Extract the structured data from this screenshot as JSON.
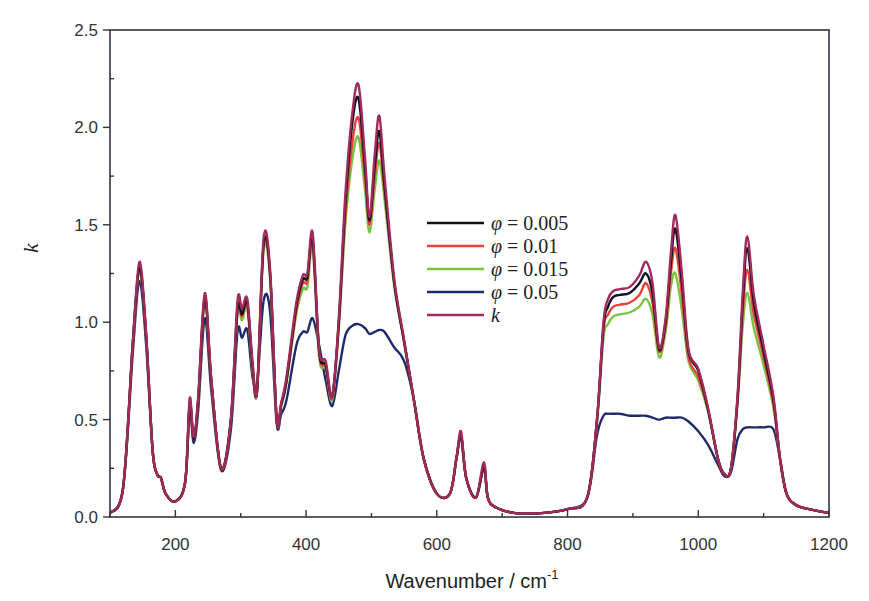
{
  "chart_data": {
    "type": "line",
    "title": "",
    "xlabel": "Wavenumber / cm-1",
    "xlabel_main": "Wavenumber / cm",
    "xlabel_sup": "-1",
    "ylabel": "k",
    "xlim": [
      100,
      1200
    ],
    "ylim": [
      0.0,
      2.5
    ],
    "xticks": [
      200,
      400,
      600,
      800,
      1000,
      1200
    ],
    "xtick_labels": [
      "200",
      "400",
      "600",
      "800",
      "1000",
      "1200"
    ],
    "yticks": [
      0.0,
      0.5,
      1.0,
      1.5,
      2.0,
      2.5
    ],
    "ytick_labels": [
      "0.0",
      "0.5",
      "1.0",
      "1.5",
      "2.0",
      "2.5"
    ],
    "grid": false,
    "legend_position": "center-right",
    "legend": [
      {
        "symbol": "φ",
        "eq": " = ",
        "value": "0.005",
        "color": "#111122"
      },
      {
        "symbol": "φ",
        "eq": " = ",
        "value": "0.01",
        "color": "#e8413a"
      },
      {
        "symbol": "φ",
        "eq": " = ",
        "value": "0.015",
        "color": "#7cc242"
      },
      {
        "symbol": "φ",
        "eq": " = ",
        "value": "0.05",
        "color": "#1f2a6b"
      },
      {
        "symbol": "k",
        "eq": "",
        "value": "",
        "color": "#a02a5a"
      }
    ],
    "x": [
      100,
      120,
      135,
      145,
      155,
      165,
      172,
      178,
      185,
      200,
      215,
      222,
      228,
      235,
      245,
      255,
      270,
      285,
      295,
      302,
      310,
      318,
      325,
      335,
      345,
      355,
      362,
      370,
      385,
      395,
      402,
      410,
      420,
      430,
      440,
      450,
      460,
      470,
      480,
      490,
      497,
      505,
      512,
      520,
      535,
      550,
      565,
      580,
      600,
      620,
      630,
      637,
      645,
      660,
      672,
      678,
      690,
      720,
      760,
      800,
      830,
      845,
      855,
      862,
      870,
      880,
      895,
      910,
      920,
      930,
      940,
      950,
      958,
      965,
      975,
      985,
      1000,
      1015,
      1030,
      1040,
      1050,
      1060,
      1068,
      1075,
      1085,
      1100,
      1115,
      1125,
      1135,
      1150,
      1170,
      1200
    ],
    "series": [
      {
        "name": "φ = 0.005",
        "color": "#111122",
        "values": [
          0.02,
          0.15,
          0.9,
          1.28,
          0.95,
          0.35,
          0.22,
          0.2,
          0.12,
          0.08,
          0.18,
          0.58,
          0.4,
          0.6,
          1.13,
          0.7,
          0.25,
          0.5,
          1.07,
          1.04,
          1.1,
          0.78,
          0.65,
          1.4,
          1.25,
          0.5,
          0.58,
          0.7,
          1.08,
          1.22,
          1.23,
          1.43,
          0.85,
          0.78,
          0.62,
          1.0,
          1.6,
          2.0,
          2.15,
          1.8,
          1.52,
          1.8,
          1.98,
          1.7,
          1.2,
          0.9,
          0.6,
          0.3,
          0.12,
          0.12,
          0.3,
          0.42,
          0.2,
          0.1,
          0.26,
          0.1,
          0.05,
          0.02,
          0.02,
          0.04,
          0.1,
          0.5,
          0.98,
          1.08,
          1.13,
          1.14,
          1.15,
          1.2,
          1.25,
          1.15,
          0.86,
          1.0,
          1.3,
          1.48,
          1.2,
          0.85,
          0.75,
          0.55,
          0.3,
          0.22,
          0.25,
          0.6,
          1.1,
          1.38,
          1.1,
          0.85,
          0.6,
          0.3,
          0.12,
          0.06,
          0.04,
          0.02
        ]
      },
      {
        "name": "φ = 0.01",
        "color": "#e8413a",
        "values": [
          0.02,
          0.15,
          0.9,
          1.27,
          0.95,
          0.35,
          0.22,
          0.2,
          0.12,
          0.08,
          0.18,
          0.57,
          0.4,
          0.6,
          1.12,
          0.7,
          0.25,
          0.5,
          1.06,
          1.03,
          1.09,
          0.77,
          0.65,
          1.39,
          1.24,
          0.5,
          0.58,
          0.7,
          1.06,
          1.2,
          1.21,
          1.41,
          0.84,
          0.77,
          0.61,
          0.99,
          1.55,
          1.9,
          2.05,
          1.75,
          1.5,
          1.75,
          1.92,
          1.68,
          1.2,
          0.9,
          0.6,
          0.3,
          0.12,
          0.12,
          0.3,
          0.42,
          0.2,
          0.1,
          0.26,
          0.1,
          0.05,
          0.02,
          0.02,
          0.04,
          0.1,
          0.5,
          0.96,
          1.04,
          1.08,
          1.09,
          1.1,
          1.14,
          1.2,
          1.1,
          0.85,
          0.98,
          1.25,
          1.38,
          1.14,
          0.82,
          0.72,
          0.55,
          0.3,
          0.22,
          0.25,
          0.6,
          1.05,
          1.27,
          1.04,
          0.82,
          0.58,
          0.3,
          0.12,
          0.06,
          0.04,
          0.02
        ]
      },
      {
        "name": "φ = 0.015",
        "color": "#7cc242",
        "values": [
          0.02,
          0.15,
          0.9,
          1.26,
          0.95,
          0.35,
          0.22,
          0.2,
          0.12,
          0.08,
          0.18,
          0.57,
          0.4,
          0.6,
          1.11,
          0.7,
          0.25,
          0.5,
          1.04,
          1.01,
          1.07,
          0.76,
          0.64,
          1.37,
          1.22,
          0.5,
          0.57,
          0.69,
          1.04,
          1.17,
          1.18,
          1.38,
          0.82,
          0.76,
          0.6,
          0.97,
          1.5,
          1.82,
          1.95,
          1.68,
          1.46,
          1.68,
          1.83,
          1.63,
          1.18,
          0.9,
          0.6,
          0.3,
          0.12,
          0.12,
          0.3,
          0.42,
          0.2,
          0.1,
          0.26,
          0.1,
          0.05,
          0.02,
          0.02,
          0.04,
          0.1,
          0.48,
          0.92,
          0.99,
          1.03,
          1.04,
          1.05,
          1.08,
          1.12,
          1.04,
          0.82,
          0.95,
          1.18,
          1.25,
          1.06,
          0.8,
          0.7,
          0.54,
          0.3,
          0.22,
          0.25,
          0.58,
          0.98,
          1.15,
          0.97,
          0.78,
          0.56,
          0.3,
          0.12,
          0.06,
          0.04,
          0.02
        ]
      },
      {
        "name": "φ = 0.05",
        "color": "#1f2a6b",
        "values": [
          0.02,
          0.15,
          0.85,
          1.21,
          0.9,
          0.35,
          0.22,
          0.2,
          0.12,
          0.08,
          0.18,
          0.55,
          0.38,
          0.55,
          1.02,
          0.65,
          0.24,
          0.45,
          0.95,
          0.92,
          0.96,
          0.72,
          0.68,
          1.11,
          1.05,
          0.48,
          0.53,
          0.6,
          0.88,
          0.95,
          0.95,
          1.02,
          0.88,
          0.7,
          0.57,
          0.75,
          0.93,
          0.98,
          0.99,
          0.97,
          0.94,
          0.95,
          0.96,
          0.95,
          0.87,
          0.8,
          0.6,
          0.3,
          0.12,
          0.12,
          0.3,
          0.41,
          0.2,
          0.1,
          0.25,
          0.1,
          0.05,
          0.02,
          0.02,
          0.04,
          0.1,
          0.42,
          0.52,
          0.53,
          0.53,
          0.53,
          0.52,
          0.52,
          0.52,
          0.51,
          0.5,
          0.51,
          0.51,
          0.51,
          0.51,
          0.49,
          0.44,
          0.37,
          0.27,
          0.21,
          0.23,
          0.4,
          0.45,
          0.46,
          0.46,
          0.46,
          0.45,
          0.3,
          0.12,
          0.06,
          0.04,
          0.02
        ]
      },
      {
        "name": "k",
        "color": "#a02a5a",
        "values": [
          0.02,
          0.15,
          0.9,
          1.31,
          0.96,
          0.35,
          0.22,
          0.2,
          0.12,
          0.08,
          0.18,
          0.61,
          0.41,
          0.62,
          1.15,
          0.71,
          0.25,
          0.5,
          1.11,
          1.07,
          1.12,
          0.8,
          0.65,
          1.43,
          1.27,
          0.5,
          0.59,
          0.72,
          1.1,
          1.24,
          1.25,
          1.46,
          0.86,
          0.8,
          0.62,
          1.02,
          1.65,
          2.05,
          2.22,
          1.85,
          1.54,
          1.86,
          2.06,
          1.75,
          1.22,
          0.91,
          0.6,
          0.3,
          0.12,
          0.12,
          0.3,
          0.44,
          0.2,
          0.1,
          0.28,
          0.1,
          0.05,
          0.02,
          0.02,
          0.04,
          0.1,
          0.5,
          1.0,
          1.12,
          1.16,
          1.17,
          1.18,
          1.24,
          1.31,
          1.2,
          0.87,
          1.02,
          1.35,
          1.55,
          1.25,
          0.86,
          0.76,
          0.56,
          0.3,
          0.22,
          0.25,
          0.62,
          1.15,
          1.44,
          1.14,
          0.88,
          0.62,
          0.3,
          0.12,
          0.06,
          0.04,
          0.02
        ]
      }
    ]
  }
}
